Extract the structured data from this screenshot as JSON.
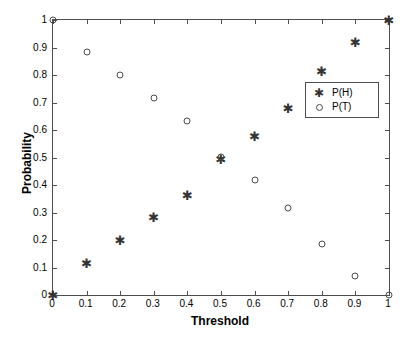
{
  "chart_data": {
    "type": "scatter",
    "title": "",
    "xlabel": "Threshold",
    "ylabel": "Probability",
    "xlim": [
      0,
      1
    ],
    "ylim": [
      0,
      1
    ],
    "grid": false,
    "legend_position": "upper right",
    "xticks": [
      "0",
      "0.1",
      "0.2",
      "0.3",
      "0.4",
      "0.5",
      "0.6",
      "0.7",
      "0.8",
      "0.9",
      "1"
    ],
    "xtick_values": [
      0,
      0.1,
      0.2,
      0.3,
      0.4,
      0.5,
      0.6,
      0.7,
      0.8,
      0.9,
      1
    ],
    "yticks": [
      "0",
      "0.1",
      "0.2",
      "0.3",
      "0.4",
      "0.5",
      "0.6",
      "0.7",
      "0.8",
      "0.9",
      "1"
    ],
    "ytick_values": [
      0,
      0.1,
      0.2,
      0.3,
      0.4,
      0.5,
      0.6,
      0.7,
      0.8,
      0.9,
      1
    ],
    "x": [
      0,
      0.1,
      0.2,
      0.3,
      0.4,
      0.5,
      0.6,
      0.7,
      0.8,
      0.9,
      1
    ],
    "series": [
      {
        "name": "P(H)",
        "marker": "asterisk",
        "color": "#333333",
        "values": [
          0,
          0.115,
          0.2,
          0.282,
          0.365,
          0.495,
          0.578,
          0.679,
          0.814,
          0.921,
          1
        ]
      },
      {
        "name": "P(T)",
        "marker": "circle",
        "color": "#4a4a4a",
        "values": [
          1,
          0.885,
          0.8,
          0.718,
          0.634,
          0.503,
          0.42,
          0.316,
          0.184,
          0.07,
          0
        ]
      }
    ]
  },
  "legend": {
    "entries": [
      {
        "label": "P(H)",
        "marker": "asterisk"
      },
      {
        "label": "P(T)",
        "marker": "circle"
      }
    ]
  },
  "axes": {
    "xlabel": "Threshold",
    "ylabel": "Probability"
  }
}
